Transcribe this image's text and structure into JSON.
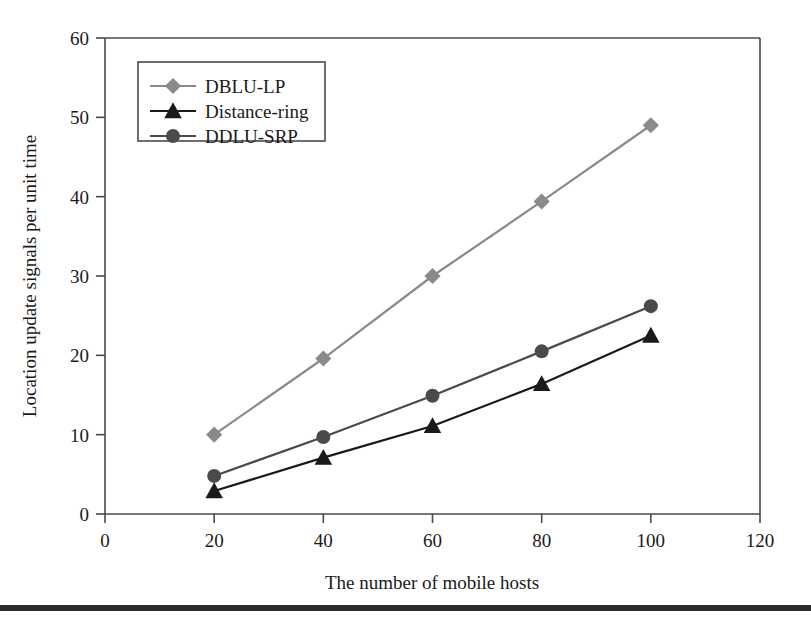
{
  "chart_data": {
    "type": "line",
    "title": "",
    "xlabel": "The number of mobile hosts",
    "ylabel": "Location update signals per unit time",
    "x": [
      20,
      40,
      60,
      80,
      100
    ],
    "xlim": [
      0,
      120
    ],
    "ylim": [
      0,
      60
    ],
    "xticks": [
      0,
      20,
      40,
      60,
      80,
      100,
      120
    ],
    "yticks": [
      0,
      10,
      20,
      30,
      40,
      50,
      60
    ],
    "xtick_labels": [
      "0",
      "20",
      "40",
      "60",
      "80",
      "100",
      "120"
    ],
    "ytick_labels": [
      "0",
      "10",
      "20",
      "30",
      "40",
      "50",
      "60"
    ],
    "grid": false,
    "legend_position": "upper-left",
    "series": [
      {
        "name": "DBLU-LP",
        "marker": "diamond",
        "color": "#8a8a8a",
        "values": [
          10.0,
          19.6,
          30.0,
          39.4,
          49.0
        ]
      },
      {
        "name": "Distance-ring",
        "marker": "triangle",
        "color": "#1a1a1a",
        "values": [
          2.9,
          7.1,
          11.1,
          16.4,
          22.5
        ]
      },
      {
        "name": "DDLU-SRP",
        "marker": "circle",
        "color": "#4a4a4a",
        "values": [
          4.8,
          9.7,
          14.9,
          20.5,
          26.2
        ]
      }
    ]
  },
  "figure": {
    "axis_color": "#4a4a4a",
    "background": "#ffffff",
    "bottom_rule_color": "#2b2b2b"
  }
}
